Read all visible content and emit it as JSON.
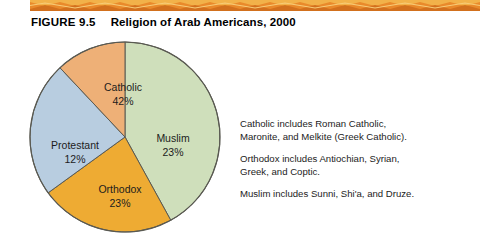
{
  "figure": {
    "number_label": "FIGURE 9.5",
    "title": "Religion of Arab Americans, 2000"
  },
  "decoration": {
    "top_band_name": "zigzag-band",
    "band_color_dark": "#d2701d",
    "band_color_mid": "#e98a2b",
    "band_color_light": "#f2b24a"
  },
  "chart_data": {
    "type": "pie",
    "title": "Religion of Arab Americans, 2000",
    "xlabel": "",
    "ylabel": "",
    "legend_position": "none",
    "grid": false,
    "categories": [
      "Catholic",
      "Muslim",
      "Orthodox",
      "Protestant"
    ],
    "values": [
      42,
      23,
      23,
      12
    ],
    "value_labels": [
      "42%",
      "23%",
      "23%",
      "12%"
    ],
    "unit": "percent",
    "start_angle_deg": 0,
    "direction": "clockwise",
    "slices": [
      {
        "name": "Catholic",
        "value": 42,
        "value_label": "42%",
        "color": "#cfdfbb",
        "start_deg": 0,
        "end_deg": 151.2,
        "label_x": 96,
        "label_y": 52,
        "value_x": 96,
        "value_y": 66
      },
      {
        "name": "Muslim",
        "value": 23,
        "value_label": "23%",
        "color": "#eeab33",
        "start_deg": 151.2,
        "end_deg": 234.0,
        "label_x": 146,
        "label_y": 103,
        "value_x": 146,
        "value_y": 117
      },
      {
        "name": "Orthodox",
        "value": 23,
        "value_label": "23%",
        "color": "#b8cde0",
        "start_deg": 234.0,
        "end_deg": 316.8,
        "label_x": 93,
        "label_y": 154,
        "value_x": 93,
        "value_y": 168
      },
      {
        "name": "Protestant",
        "value": 12,
        "value_label": "12%",
        "color": "#eeb077",
        "start_deg": 316.8,
        "end_deg": 360.0,
        "label_x": 48,
        "label_y": 110,
        "value_x": 48,
        "value_y": 124
      }
    ],
    "annotations": [
      "Catholic includes Roman Catholic, Maronite, and Melkite (Greek Catholic).",
      "Orthodox includes Antiochian, Syrian, Greek, and Coptic.",
      "Muslim includes Sunni, Shi'a, and Druze."
    ]
  },
  "notes": [
    {
      "line1": "Catholic includes Roman Catholic,",
      "line2": "Maronite, and Melkite (Greek Catholic)."
    },
    {
      "line1": "Orthodox includes Antiochian, Syrian,",
      "line2": "Greek, and Coptic."
    },
    {
      "line1": "Muslim includes Sunni, Shi'a, and Druze.",
      "line2": ""
    }
  ]
}
